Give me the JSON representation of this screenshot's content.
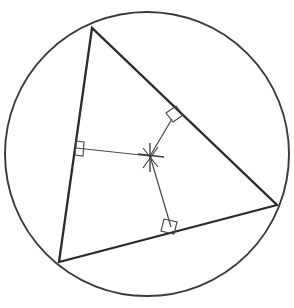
{
  "figure": {
    "kind": "geometry-diagram",
    "canvas": {
      "width": 294,
      "height": 308,
      "background": "#ffffff"
    },
    "colors": {
      "circle_stroke": "#3a3a3a",
      "triangle_stroke": "#2b2b2b",
      "radius_stroke": "#4a4a4a",
      "rightangle_stroke": "#4a4a4a",
      "center_mark_stroke": "#3a3a3a"
    },
    "stroke_widths": {
      "circle": 1.9,
      "triangle": 2.3,
      "radius": 1.25,
      "rightangle": 1.2,
      "center_mark": 1.3
    },
    "circle": {
      "label": "circumscribed-circle",
      "center_x": 147,
      "center_y": 154,
      "radius": 142
    },
    "center_point": {
      "label": "circumcenter",
      "x": 150,
      "y": 156,
      "marker": "cross-tick",
      "tick_arms": [
        {
          "x1": 138,
          "y1": 154,
          "x2": 164,
          "y2": 157
        },
        {
          "x1": 150,
          "y1": 143,
          "x2": 150,
          "y2": 172
        },
        {
          "x1": 143,
          "y1": 148,
          "x2": 158,
          "y2": 167
        },
        {
          "x1": 158,
          "y1": 147,
          "x2": 143,
          "y2": 168
        }
      ]
    },
    "vertices": [
      {
        "name": "vertex-top",
        "x": 92,
        "y": 28
      },
      {
        "name": "vertex-bottom-left",
        "x": 59,
        "y": 262
      },
      {
        "name": "vertex-right",
        "x": 277,
        "y": 205
      }
    ],
    "triangle_points": "92,28 59,262 277,205",
    "sides": [
      {
        "name": "side-left",
        "from": "vertex-top",
        "to": "vertex-bottom-left"
      },
      {
        "name": "side-bottom",
        "from": "vertex-bottom-left",
        "to": "vertex-right"
      },
      {
        "name": "side-hypotenuse",
        "from": "vertex-right",
        "to": "vertex-top"
      }
    ],
    "perpendicular_segments": [
      {
        "name": "radius-to-left-side",
        "x1": 150,
        "y1": 156,
        "x2": 76,
        "y2": 148
      },
      {
        "name": "radius-to-bottom-side",
        "x1": 150,
        "y1": 156,
        "x2": 171,
        "y2": 227
      },
      {
        "name": "radius-to-hypotenuse",
        "x1": 150,
        "y1": 156,
        "x2": 172,
        "y2": 119
      }
    ],
    "right_angle_marks": [
      {
        "name": "right-angle-left-side",
        "points": "76,141 84,142 83,156 75,155"
      },
      {
        "name": "right-angle-bottom-side",
        "points": "164,219 177,222 174,234 161,231"
      },
      {
        "name": "right-angle-hypotenuse",
        "points": "166,113 176,106 183,115 173,122"
      }
    ]
  }
}
